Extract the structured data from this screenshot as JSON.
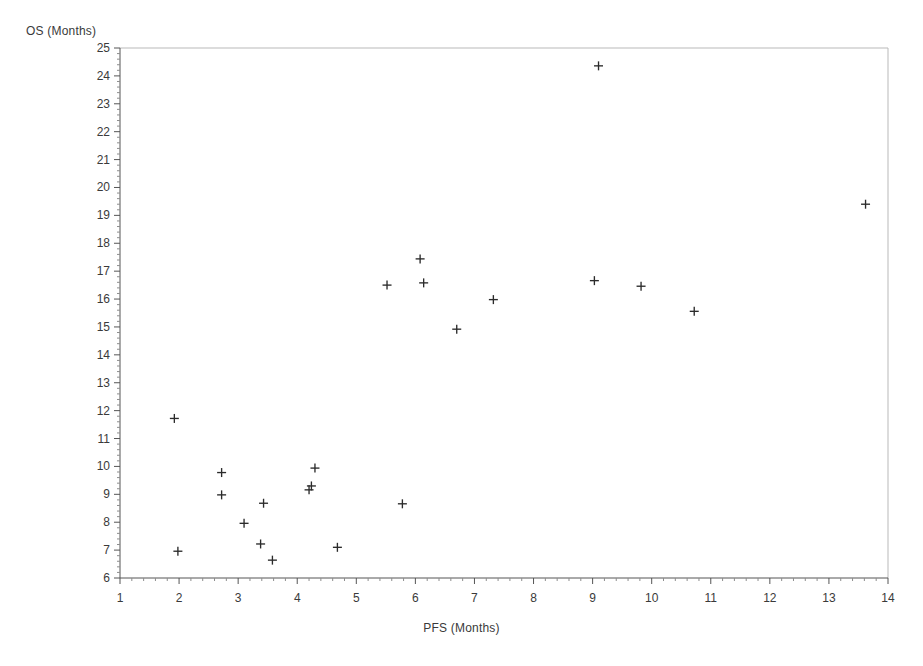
{
  "chart_data": {
    "type": "scatter",
    "title": "",
    "xlabel": "PFS (Months)",
    "ylabel": "OS (Months)",
    "xlim": [
      1,
      14
    ],
    "ylim": [
      6,
      25
    ],
    "grid": false,
    "legend": null,
    "marker": "plus",
    "marker_color": "#2b2b2b",
    "xticks": [
      1,
      2,
      3,
      4,
      5,
      6,
      7,
      8,
      9,
      10,
      11,
      12,
      13,
      14
    ],
    "yticks": [
      6,
      7,
      8,
      9,
      10,
      11,
      12,
      13,
      14,
      15,
      16,
      17,
      18,
      19,
      20,
      21,
      22,
      23,
      24,
      25
    ],
    "xtick_labels": [
      "1",
      "2",
      "3",
      "4",
      "5",
      "6",
      "7",
      "8",
      "9",
      "10",
      "11",
      "12",
      "13",
      "14"
    ],
    "ytick_labels": [
      "6",
      "7",
      "8",
      "9",
      "10",
      "11",
      "12",
      "13",
      "14",
      "15",
      "16",
      "17",
      "18",
      "19",
      "20",
      "21",
      "22",
      "23",
      "24",
      "25"
    ],
    "minor_ticks_per_interval": 5,
    "n_points": 23,
    "x": [
      1.92,
      1.98,
      2.72,
      2.72,
      3.1,
      3.38,
      3.43,
      3.58,
      4.2,
      4.24,
      4.3,
      4.68,
      5.52,
      5.78,
      6.08,
      6.14,
      6.7,
      7.32,
      9.1,
      9.03,
      9.82,
      10.72,
      13.62
    ],
    "y": [
      11.72,
      6.96,
      9.78,
      8.98,
      7.96,
      7.22,
      8.68,
      6.64,
      9.16,
      9.3,
      9.94,
      7.1,
      16.5,
      8.66,
      17.44,
      16.58,
      14.92,
      15.98,
      24.36,
      16.66,
      16.46,
      15.56,
      19.4
    ],
    "points": [
      {
        "x": 1.92,
        "y": 11.72
      },
      {
        "x": 1.98,
        "y": 6.96
      },
      {
        "x": 2.72,
        "y": 9.78
      },
      {
        "x": 2.72,
        "y": 8.98
      },
      {
        "x": 3.1,
        "y": 7.96
      },
      {
        "x": 3.38,
        "y": 7.22
      },
      {
        "x": 3.43,
        "y": 8.68
      },
      {
        "x": 3.58,
        "y": 6.64
      },
      {
        "x": 4.2,
        "y": 9.16
      },
      {
        "x": 4.24,
        "y": 9.3
      },
      {
        "x": 4.3,
        "y": 9.94
      },
      {
        "x": 4.68,
        "y": 7.1
      },
      {
        "x": 5.52,
        "y": 16.5
      },
      {
        "x": 5.78,
        "y": 8.66
      },
      {
        "x": 6.08,
        "y": 17.44
      },
      {
        "x": 6.14,
        "y": 16.58
      },
      {
        "x": 6.7,
        "y": 14.92
      },
      {
        "x": 7.32,
        "y": 15.98
      },
      {
        "x": 9.1,
        "y": 24.36
      },
      {
        "x": 9.03,
        "y": 16.66
      },
      {
        "x": 9.82,
        "y": 16.46
      },
      {
        "x": 10.72,
        "y": 15.56
      },
      {
        "x": 13.62,
        "y": 19.4
      }
    ]
  },
  "colors": {
    "background": "#ffffff",
    "frame": "#b9b9b9",
    "axis": "#555555",
    "text": "#3a3a3a",
    "marker": "#2b2b2b"
  }
}
